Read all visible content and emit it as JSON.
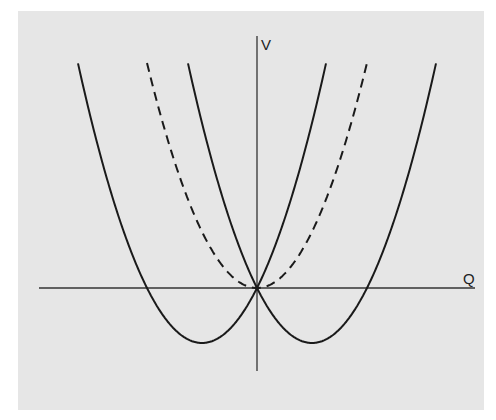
{
  "diagram": {
    "axes": {
      "x_label": "Q",
      "y_label": "V"
    },
    "colors": {
      "background": "#e6e6e6",
      "line": "#1a1a1a"
    },
    "curves": [
      {
        "name": "left-solid-parabola",
        "style": "solid",
        "vertex": [
          -55,
          -55
        ],
        "roots": [
          -110,
          0
        ]
      },
      {
        "name": "right-solid-parabola",
        "style": "solid",
        "vertex": [
          55,
          -55
        ],
        "roots": [
          0,
          110
        ]
      },
      {
        "name": "center-dashed-parabola",
        "style": "dashed",
        "vertex": [
          0,
          0
        ]
      }
    ]
  }
}
